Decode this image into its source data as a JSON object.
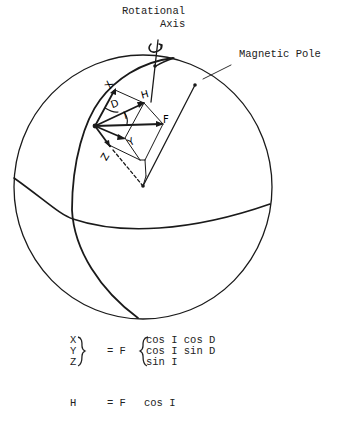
{
  "diagram": {
    "title_labels": {
      "rotational_axis_line1": "Rotational",
      "rotational_axis_line2": "Axis",
      "magnetic_pole": "Magnetic Pole"
    },
    "vector_labels": {
      "x": "X",
      "y": "Y",
      "z": "Z",
      "h": "H",
      "f": "F",
      "d": "D",
      "i": "I"
    },
    "colors": {
      "ink": "#1a1a1a",
      "background": "#ffffff"
    }
  },
  "equations": {
    "system": {
      "lhs": [
        "X",
        "Y",
        "Z"
      ],
      "equals": "= F",
      "rhs": [
        "cos I cos D",
        "cos I sin D",
        "sin I"
      ]
    },
    "horizontal": {
      "lhs": "H",
      "equals": "= F",
      "rhs": "cos I"
    }
  }
}
